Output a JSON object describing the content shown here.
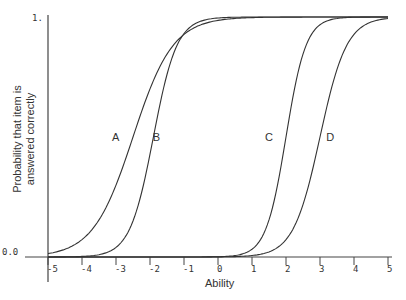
{
  "chart_data": {
    "type": "line",
    "title": "",
    "xlabel": "Ability",
    "ylabel": "Probability that item is answered correctly",
    "xlim": [
      -5,
      5
    ],
    "ylim": [
      0,
      1
    ],
    "x_ticks": [
      "-5",
      "-4",
      "-3",
      "-2",
      "-1",
      "0",
      "1",
      "2",
      "3",
      "4",
      "5"
    ],
    "y_ticks": [
      "0.0",
      "1."
    ],
    "grid": false,
    "legend": "inline labels",
    "series": [
      {
        "name": "A",
        "difficulty": -2.5,
        "discrimination": 1.0,
        "label_pos": [
          -3,
          0.5
        ]
      },
      {
        "name": "B",
        "difficulty": -1.9,
        "discrimination": 1.7,
        "label_pos": [
          -1.8,
          0.5
        ]
      },
      {
        "name": "C",
        "difficulty": 2.0,
        "discrimination": 2.0,
        "label_pos": [
          1.5,
          0.5
        ]
      },
      {
        "name": "D",
        "difficulty": 3.0,
        "discrimination": 1.5,
        "label_pos": [
          3.3,
          0.5
        ]
      }
    ]
  },
  "labels": {
    "xlabel": "Ability",
    "ylabel_line1": "Probability that item is",
    "ylabel_line2": "answered correctly"
  }
}
